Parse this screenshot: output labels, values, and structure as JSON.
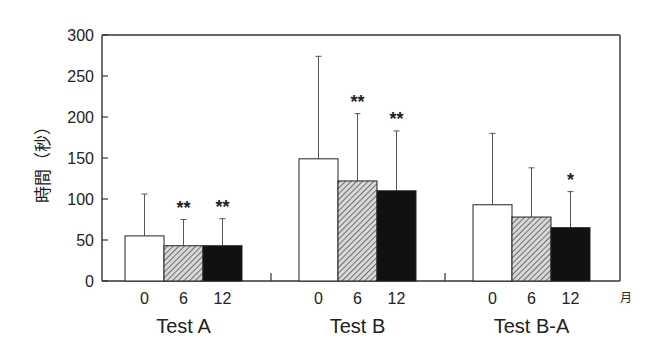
{
  "chart_data": {
    "type": "bar",
    "title": "",
    "ylabel": "時間（秒）",
    "xlabel": "",
    "x_unit_label": "月",
    "ylim": [
      0,
      300
    ],
    "yticks": [
      0,
      50,
      100,
      150,
      200,
      250,
      300
    ],
    "grid": false,
    "legend": "none",
    "subcategories": [
      "0",
      "6",
      "12"
    ],
    "series_fills": [
      "#ffffff",
      "#9a9a9a",
      "#111111"
    ],
    "series_patterns": [
      "solid-white",
      "diagonal-hatch",
      "solid-black"
    ],
    "groups": [
      {
        "name": "Test A",
        "values": [
          55,
          43,
          43
        ],
        "error_upper": [
          106,
          75,
          76
        ],
        "significance": [
          "",
          "**",
          "**"
        ]
      },
      {
        "name": "Test B",
        "values": [
          149,
          122,
          110
        ],
        "error_upper": [
          274,
          204,
          183
        ],
        "significance": [
          "",
          "**",
          "**"
        ]
      },
      {
        "name": "Test B-A",
        "values": [
          93,
          78,
          65
        ],
        "error_upper": [
          180,
          138,
          109
        ],
        "significance": [
          "",
          "",
          "*"
        ]
      }
    ]
  }
}
